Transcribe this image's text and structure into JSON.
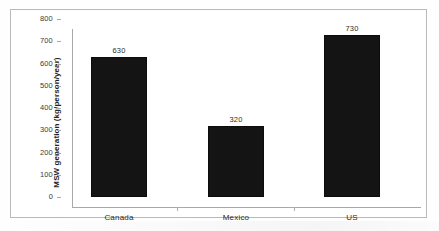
{
  "chart_data": {
    "type": "bar",
    "title": "",
    "xlabel": "",
    "ylabel": "MSW generation (kg/person/year)",
    "categories": [
      "Canada",
      "Mexico",
      "US"
    ],
    "values": [
      630,
      320,
      730
    ],
    "data_labels": [
      "630",
      "320",
      "730"
    ],
    "ylim": [
      0,
      800
    ],
    "yticks": [
      800,
      700,
      600,
      500,
      400,
      300,
      200,
      100,
      0
    ],
    "ytick_labels": [
      "800",
      "700",
      "600",
      "500",
      "400",
      "300",
      "200",
      "100",
      "0"
    ],
    "grid": false,
    "legend": null,
    "series": [
      {
        "name": "MSW generation",
        "values": [
          630,
          320,
          730
        ]
      }
    ],
    "bar_color": "#141414",
    "axis_color": "#a8a8a8",
    "background_color": "#ffffff"
  }
}
